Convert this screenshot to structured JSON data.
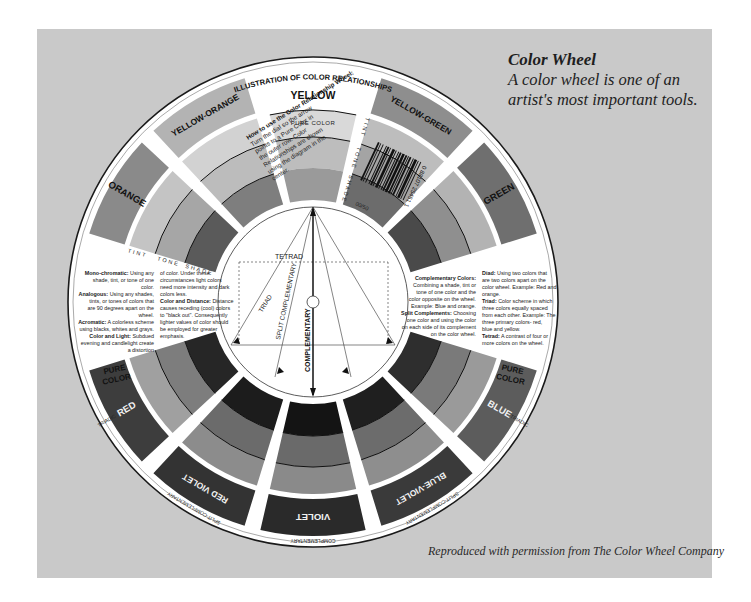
{
  "caption": {
    "title": "Color Wheel",
    "subtitle": "A color wheel is one of an artist's most important tools.",
    "credit": "Reproduced with permission from The Color Wheel Company"
  },
  "wheel": {
    "header": "ILLUSTRATION OF COLOR RELATIONSHIPS",
    "top_color": "YELLOW",
    "pure_color_label": "PURE COLOR",
    "pure_color_left": "PURE COLOR",
    "pure_color_right": "PURE COLOR",
    "ring_labels": {
      "tint": "TINT",
      "tone": "TONE",
      "shade": "SHADE"
    },
    "barcode_number": "0 88107 25451 1",
    "barcode_code": "00/50",
    "segments": [
      {
        "name": "YELLOW-GREEN",
        "angle": 30,
        "sub": ""
      },
      {
        "name": "GREEN",
        "angle": 60,
        "sub": ""
      },
      {
        "name": "BLUE",
        "angle": 120,
        "sub": "TRIADIC"
      },
      {
        "name": "BLUE-VIOLET",
        "angle": 150,
        "sub": "SPLIT-COMPLEMENTARY"
      },
      {
        "name": "VIOLET",
        "angle": 180,
        "sub": "COMPLEMENTARY"
      },
      {
        "name": "RED VIOLET",
        "angle": 210,
        "sub": "SPLIT-COMPLEMENTARY"
      },
      {
        "name": "RED",
        "angle": 240,
        "sub": "TRIADIC"
      },
      {
        "name": "ORANGE",
        "angle": 300,
        "sub": ""
      },
      {
        "name": "YELLOW-ORANGE",
        "angle": 330,
        "sub": ""
      }
    ],
    "how_to": {
      "title": "How to use the Color Relationship Wheel:",
      "body": "Turn the dial so the arrow points to a Pure Color in the outer row. Color Relationships are shown using the diagram in the center."
    },
    "left_text": {
      "col1": [
        {
          "term": "Mono-chromatic:",
          "text": "Using any shade, tint, or tone of one color."
        },
        {
          "term": "Analogous:",
          "text": "Using any shades, tints, or tones of colors that are 90 degrees apart on the wheel."
        },
        {
          "term": "Acromatic:",
          "text": "A colorless scheme using blacks, whites and grays."
        },
        {
          "term": "Color and Light:",
          "text": "Subdued evening and candlelight create a distortion"
        }
      ],
      "col2": [
        {
          "term": "",
          "text": "of color. Under these circumstances light colors need more intensity and dark colors less."
        },
        {
          "term": "Color and Distance:",
          "text": "Distance causes receding (cool) colors to \"black out\". Consequently lighter values of color should be employed for greater emphasis."
        }
      ]
    },
    "right_text": {
      "col1": [
        {
          "term": "Complementary Colors:",
          "text": "Combining a shade, tint or tone of one color and the color opposite on the wheel. Example: Blue and orange."
        },
        {
          "term": "Split Complements:",
          "text": "Choosing one color and using the color on each side of its complement on the color wheel."
        }
      ],
      "col2": [
        {
          "term": "Diad:",
          "text": "Using two colors that are two colors apart on the color wheel. Example: Red and orange."
        },
        {
          "term": "Triad:",
          "text": "Color scheme in which three colors equally spaced from each other. Example: The three primary colors- red, blue and yellow."
        },
        {
          "term": "Tetrad:",
          "text": "A contrast of four or more colors on the wheel."
        }
      ]
    },
    "diagram": {
      "tetrad": "TETRAD",
      "triad": "TRIAD",
      "split": "SPLIT COMPLEMENTARY",
      "complementary": "COMPLEMENTARY"
    },
    "colors": {
      "panel": "#c9c9c9",
      "wheel_face": "#ffffff",
      "outline": "#1a1a1a"
    }
  }
}
